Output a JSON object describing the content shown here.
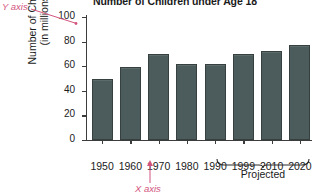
{
  "chart_data": {
    "type": "bar",
    "title": "Number of Children under Age 18",
    "xlabel": "",
    "ylabel": "Number of Children (in millions)",
    "ylabel_line1": "Number of Children",
    "ylabel_line2": "(in millions)",
    "categories": [
      "1950",
      "1960",
      "1970",
      "1980",
      "1990",
      "1999",
      "2010",
      "2020"
    ],
    "values": [
      50,
      59,
      70,
      62,
      62,
      70,
      72,
      77
    ],
    "ylim": [
      0,
      100
    ],
    "yticks": [
      "0",
      "20",
      "40",
      "60",
      "80",
      "100"
    ],
    "ytick_values": [
      0,
      20,
      40,
      60,
      80,
      100
    ],
    "grid": false,
    "legend": "none",
    "bar_color": "#4c5b5b",
    "axis_color": "#3c3c3c",
    "annotation_color": "#d2547e",
    "annotations": [
      {
        "name": "projected-bracket",
        "label": "Projected",
        "covers": [
          "1999",
          "2010",
          "2020"
        ]
      },
      {
        "name": "y-axis-callout",
        "label": "Y axis"
      },
      {
        "name": "x-axis-callout",
        "label": "X axis"
      }
    ]
  },
  "annotations": {
    "y_axis": "Y axis",
    "x_axis": "X axis",
    "projected": "Projected"
  }
}
